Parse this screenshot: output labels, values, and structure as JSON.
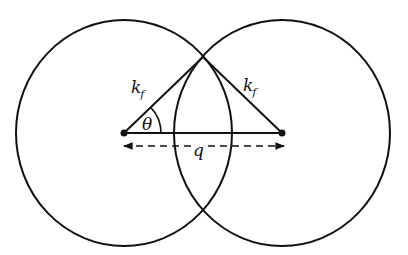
{
  "diagram": {
    "type": "geometric",
    "colors": {
      "stroke": "#111111",
      "background": "#ffffff"
    },
    "circles": [
      {
        "name": "left-circle",
        "cx": 124,
        "cy": 133,
        "rx": 108,
        "ry": 113
      },
      {
        "name": "right-circle",
        "cx": 282,
        "cy": 133,
        "rx": 108,
        "ry": 113
      }
    ],
    "points": {
      "left_center": {
        "x": 124,
        "y": 133
      },
      "right_center": {
        "x": 282,
        "y": 133
      },
      "top_intersection": {
        "x": 203,
        "y": 57
      }
    },
    "labels": {
      "left_radius": {
        "main": "k",
        "sub": "f"
      },
      "right_radius": {
        "main": "k",
        "sub": "f"
      },
      "angle": "θ",
      "separation": "q"
    }
  }
}
